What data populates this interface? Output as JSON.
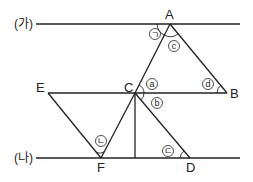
{
  "diagram": {
    "lines": {
      "top": {
        "label": "(가)"
      },
      "bottom": {
        "label": "(나)"
      }
    },
    "points": {
      "A": "A",
      "B": "B",
      "C": "C",
      "D": "D",
      "E": "E",
      "F": "F"
    },
    "angle_marks": {
      "giyeok": "ㄱ",
      "nieun": "ㄴ",
      "digeut": "ㄷ",
      "a": "a",
      "b": "b",
      "c": "c",
      "d": "d"
    },
    "colors": {
      "stroke": "#222222",
      "background": "#ffffff"
    }
  }
}
